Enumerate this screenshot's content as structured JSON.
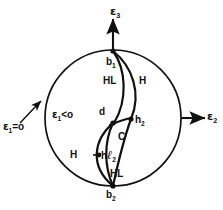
{
  "figure": {
    "type": "stereographic-projection-diagram",
    "background_color": "#ffffff",
    "line_color": "#111111",
    "axes": [
      {
        "id": "e3",
        "symbol": "ε",
        "subscript": "3",
        "direction": "up",
        "label": "ε"
      },
      {
        "id": "e2",
        "symbol": "ε",
        "subscript": "2",
        "direction": "right",
        "label": "ε"
      }
    ],
    "conditions": [
      {
        "id": "e1-eq-0",
        "symbol": "ε",
        "subscript": "1",
        "relation": "=o",
        "text": "=o"
      },
      {
        "id": "e1-lt-0",
        "symbol": "ε",
        "subscript": "1",
        "relation": "<o",
        "text": "<o"
      }
    ],
    "points": [
      {
        "id": "b1",
        "symbol": "b",
        "subscript": "1"
      },
      {
        "id": "b2",
        "symbol": "b",
        "subscript": "2"
      },
      {
        "id": "h2",
        "symbol": "h",
        "subscript": "2"
      },
      {
        "id": "d",
        "symbol": "d",
        "subscript": ""
      },
      {
        "id": "hl2",
        "symbol": "h",
        "subscript": "2",
        "extra": "ℓ"
      }
    ],
    "regions": [
      {
        "id": "hl-upper",
        "label": "HL"
      },
      {
        "id": "h-upper",
        "label": "H"
      },
      {
        "id": "c-middle",
        "label": "C"
      },
      {
        "id": "h-lower",
        "label": "H"
      },
      {
        "id": "hl-lower",
        "label": "HL"
      }
    ],
    "circle": {
      "cx": 113,
      "cy": 118,
      "r": 68
    }
  }
}
